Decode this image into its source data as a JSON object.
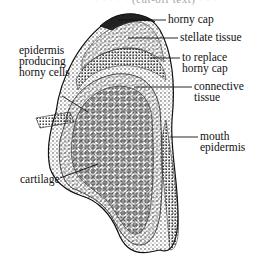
{
  "figure": {
    "top_cutoff_text": "· · · · · (cut-off text) · · · ·",
    "labels": {
      "horny_cap": "horny cap",
      "stellate_tissue": "stellate tissue",
      "to_replace_horny_cap": [
        "to replace",
        "horny cap"
      ],
      "connective_tissue": [
        "connective",
        "tissue"
      ],
      "mouth_epidermis": [
        "mouth",
        "epidermis"
      ],
      "epidermis_producing_horny_cells": [
        "epidermis",
        "producing",
        "horny cells"
      ],
      "cartilage": "cartilage"
    },
    "colors": {
      "ink": "#111111",
      "background": "#ffffff"
    }
  }
}
